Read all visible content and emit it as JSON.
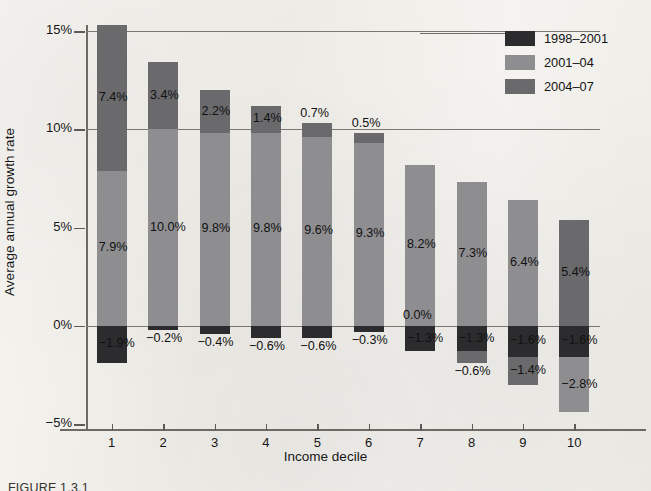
{
  "figure": {
    "caption": "FIGURE 1.3.1"
  },
  "chart_data": {
    "type": "bar",
    "subtype": "stacked-bar-with-negatives",
    "title": "",
    "xlabel": "Income decile",
    "ylabel": "Average annual growth rate",
    "categories": [
      "1",
      "2",
      "3",
      "4",
      "5",
      "6",
      "7",
      "8",
      "9",
      "10"
    ],
    "ylim": [
      -5,
      15
    ],
    "yticks": [
      -5,
      0,
      5,
      10,
      15
    ],
    "ytick_labels": [
      "−5%",
      "0%",
      "5%",
      "10%",
      "15%"
    ],
    "grid": true,
    "gridlines": [
      0,
      10,
      15
    ],
    "legend_position": "top-right",
    "value_suffix": "%",
    "series": [
      {
        "name": "1998–2001",
        "color": "#2c2c2e",
        "values": [
          -1.9,
          -0.2,
          -0.4,
          -0.6,
          -0.6,
          -0.3,
          -1.3,
          -1.3,
          -1.6,
          -1.6
        ],
        "labels": [
          "−1.9%",
          "−0.2%",
          "−0.4%",
          "−0.6%",
          "−0.6%",
          "−0.3%",
          "−1.3%",
          "−1.3%",
          "−1.6%",
          "−1.6%"
        ]
      },
      {
        "name": "2001–04",
        "color": "#8e8e90",
        "values": [
          7.9,
          10.0,
          9.8,
          9.8,
          9.6,
          9.3,
          8.2,
          7.3,
          6.4,
          -2.8
        ],
        "labels": [
          "7.9%",
          "10.0%",
          "9.8%",
          "9.8%",
          "9.6%",
          "9.3%",
          "8.2%",
          "7.3%",
          "6.4%",
          "−2.8%"
        ]
      },
      {
        "name": "2004–07",
        "color": "#6a6a6c",
        "values": [
          7.4,
          3.4,
          2.2,
          1.4,
          0.7,
          0.5,
          0.0,
          -0.6,
          -1.4,
          5.4
        ],
        "labels": [
          "7.4%",
          "3.4%",
          "2.2%",
          "1.4%",
          "0.7%",
          "0.5%",
          "0.0%",
          "−0.6%",
          "−1.4%",
          "5.4%"
        ]
      }
    ],
    "bar_tops_percent": [
      15.3,
      13.0,
      12.0,
      11.0,
      10.0,
      9.7,
      8.0,
      7.0,
      6.0,
      5.0
    ],
    "bar_bottoms_percent": [
      -2.1,
      -0.3,
      -0.5,
      -0.7,
      -0.7,
      -0.4,
      -1.4,
      -2.1,
      -3.2,
      -4.2
    ]
  }
}
